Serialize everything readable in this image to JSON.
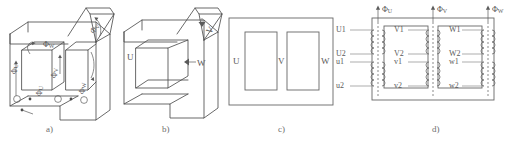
{
  "figure": {
    "panel_count": 4
  },
  "captions": {
    "a": "a)",
    "b": "b)",
    "c": "c)",
    "d": "d)"
  },
  "panel_a": {
    "name": "three-leg core isometric with flux directions",
    "flux_labels": [
      {
        "key": "phi_u_top",
        "symbol": "Φ",
        "subscript": "U"
      },
      {
        "key": "phi_v_top",
        "symbol": "Φ",
        "subscript": "V"
      },
      {
        "key": "phi_w_top",
        "symbol": "Φ",
        "subscript": "W"
      },
      {
        "key": "phi_u_left",
        "symbol": "Φ",
        "subscript": "U"
      },
      {
        "key": "phi_v_mid",
        "symbol": "Φ",
        "subscript": "V"
      },
      {
        "key": "phi_w_right",
        "symbol": "Φ",
        "subscript": "W"
      }
    ],
    "current_markers": 3
  },
  "panel_b": {
    "name": "three-leg core isometric with limb designations",
    "limb_labels": [
      {
        "key": "limb_u",
        "text": "U"
      },
      {
        "key": "limb_v",
        "text": "V"
      },
      {
        "key": "limb_w",
        "text": "W"
      }
    ]
  },
  "panel_c": {
    "name": "planar core outline with limb designations",
    "limb_labels": [
      {
        "key": "limb_u",
        "text": "U"
      },
      {
        "key": "limb_v",
        "text": "V"
      },
      {
        "key": "limb_w",
        "text": "W"
      }
    ]
  },
  "panel_d": {
    "name": "winding connection schematic",
    "flux_labels": [
      {
        "key": "phi_u",
        "symbol": "Φ",
        "subscript": "U"
      },
      {
        "key": "phi_v",
        "symbol": "Φ",
        "subscript": "V"
      },
      {
        "key": "phi_w",
        "symbol": "Φ",
        "subscript": "W"
      }
    ],
    "terminals_left": [
      {
        "key": "U1",
        "text": "U1"
      },
      {
        "key": "U2",
        "text": "U2"
      },
      {
        "key": "u1",
        "text": "u1"
      },
      {
        "key": "u2",
        "text": "u2"
      }
    ],
    "terminals_middle": [
      {
        "key": "V1",
        "text": "V1"
      },
      {
        "key": "V2",
        "text": "V2"
      },
      {
        "key": "v1",
        "text": "v1"
      },
      {
        "key": "v2",
        "text": "v2"
      }
    ],
    "terminals_right": [
      {
        "key": "W1",
        "text": "W1"
      },
      {
        "key": "W2",
        "text": "W2"
      },
      {
        "key": "w1",
        "text": "w1"
      },
      {
        "key": "w2",
        "text": "w2"
      }
    ]
  },
  "colors": {
    "line": "#4f4f4f",
    "text": "#5a5a5a",
    "caption": "#6e6e6e",
    "background": "#ffffff"
  }
}
